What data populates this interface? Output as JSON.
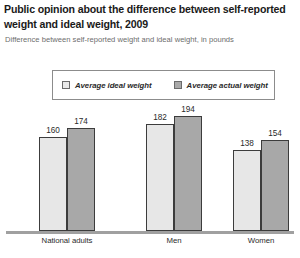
{
  "header": {
    "title": "Public opinion about the difference between self-reported weight and ideal weight, 2009",
    "subtitle": "Difference between self-reported weight and ideal weight, in pounds"
  },
  "legend": {
    "items": [
      {
        "label": "Average ideal weight",
        "swatch": "light",
        "color": "#e9e9e9"
      },
      {
        "label": "Average actual weight",
        "swatch": "dark",
        "color": "#a9a9a9"
      }
    ]
  },
  "chart_data": {
    "type": "bar",
    "title": "Public opinion about the difference between self-reported weight and ideal weight, 2009",
    "subtitle": "Difference between self-reported weight and ideal weight, in pounds",
    "xlabel": "",
    "ylabel": "Pounds",
    "ylim": [
      0,
      210
    ],
    "grid": false,
    "legend_position": "top",
    "categories": [
      "National adults",
      "Men",
      "Women"
    ],
    "series": [
      {
        "name": "Average ideal weight",
        "color": "#e7e7e7",
        "values": [
          160,
          182,
          138
        ]
      },
      {
        "name": "Average actual weight",
        "color": "#a8a8a8",
        "values": [
          174,
          194,
          154
        ]
      }
    ],
    "value_labels": [
      [
        "160",
        "174"
      ],
      [
        "182",
        "194"
      ],
      [
        "138",
        "154"
      ]
    ]
  },
  "colors": {
    "ideal_fill": "#e7e7e7",
    "actual_fill": "#a8a8a8",
    "bar_border": "#3c3c3c",
    "baseline": "#a0a0a0",
    "title": "#1a1a1a",
    "subtitle": "#6d6d6d"
  }
}
